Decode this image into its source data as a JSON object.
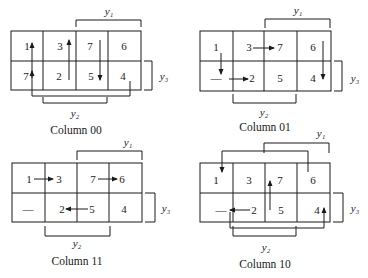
{
  "diagrams": [
    {
      "caption": "Column 00",
      "cells": [
        "1",
        "3",
        "7",
        "6",
        "7",
        "2",
        "5",
        "4"
      ],
      "labels": {
        "y1": "y₁",
        "y2": "y₂",
        "y3": "y₃"
      }
    },
    {
      "caption": "Column 01",
      "cells": [
        "1",
        "3",
        "7",
        "6",
        "—",
        "2",
        "5",
        "4"
      ],
      "labels": {
        "y1": "y₁",
        "y2": "y₂",
        "y3": "y₃"
      }
    },
    {
      "caption": "Column 11",
      "cells": [
        "1",
        "3",
        "7",
        "6",
        "—",
        "2",
        "5",
        "4"
      ],
      "labels": {
        "y1": "y₁",
        "y2": "y₂",
        "y3": "y₃"
      }
    },
    {
      "caption": "Column 10",
      "cells": [
        "1",
        "3",
        "7",
        "6",
        "—",
        "2",
        "5",
        "4"
      ],
      "labels": {
        "y1": "y₁",
        "y2": "y₂",
        "y3": "y₃"
      }
    }
  ],
  "colors": {
    "line": "#1a1a1a",
    "background": "#ffffff"
  }
}
